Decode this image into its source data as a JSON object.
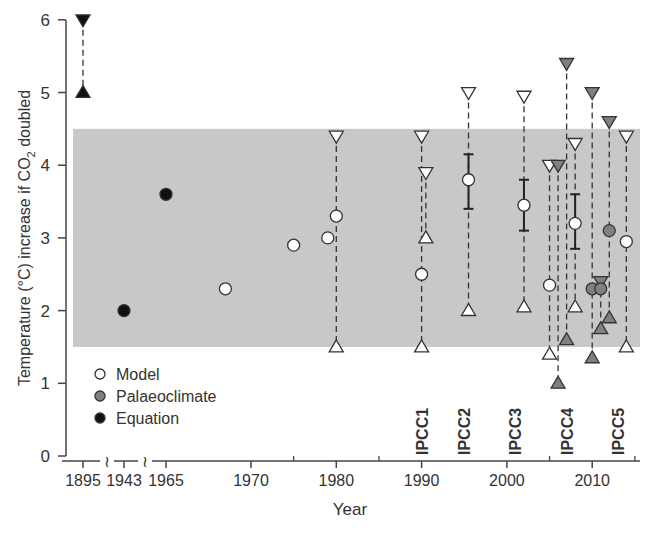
{
  "chart_data": {
    "type": "scatter",
    "title": "",
    "xlabel": "Year",
    "ylabel": "Temperature (°C) increase if CO2 doubled",
    "ylabel_parts": {
      "pre": "Temperature (°C) increase if CO",
      "sub": "2",
      "post": " doubled"
    },
    "ylim": [
      0,
      6
    ],
    "yticks": [
      0,
      1,
      2,
      3,
      4,
      5,
      6
    ],
    "xticks_broken": [
      "1895",
      "1943",
      "1965"
    ],
    "xticks": [
      "1970",
      "1980",
      "1990",
      "2000",
      "2010"
    ],
    "axis_break_symbol": "≀",
    "shaded_band": {
      "low": 1.5,
      "high": 4.5,
      "color": "#c8c8c8"
    },
    "legend": [
      {
        "label": "Model",
        "marker": "circle",
        "fill": "#ffffff"
      },
      {
        "label": "Palaeoclimate",
        "marker": "circle",
        "fill": "#808080"
      },
      {
        "label": "Equation",
        "marker": "circle",
        "fill": "#111111"
      }
    ],
    "ipcc_reports": [
      {
        "label": "IPCC1",
        "year": 1990
      },
      {
        "label": "IPCC2",
        "year": 1995
      },
      {
        "label": "IPCC3",
        "year": 2001
      },
      {
        "label": "IPCC4",
        "year": 2007
      },
      {
        "label": "IPCC5",
        "year": 2013
      }
    ],
    "colors": {
      "model": "#ffffff",
      "palaeoclimate": "#808080",
      "equation": "#111111",
      "stroke": "#333333"
    },
    "points": [
      {
        "type": "equation",
        "x": "1943",
        "y": 2.0
      },
      {
        "type": "equation",
        "x": "1965",
        "y": 3.6
      },
      {
        "type": "model",
        "x": 1967,
        "y": 2.3
      },
      {
        "type": "model",
        "x": 1975,
        "y": 2.9
      },
      {
        "type": "model",
        "x": 1979,
        "y": 3.0
      },
      {
        "type": "model",
        "x": 1980,
        "y": 3.3
      },
      {
        "type": "model",
        "x": 1990,
        "y": 2.5
      },
      {
        "type": "model",
        "x": 1995.5,
        "y": 3.8
      },
      {
        "type": "model",
        "x": 2002,
        "y": 3.45
      },
      {
        "type": "model",
        "x": 2005,
        "y": 2.35
      },
      {
        "type": "model",
        "x": 2008,
        "y": 3.2
      },
      {
        "type": "palaeoclimate",
        "x": 2010,
        "y": 2.3
      },
      {
        "type": "palaeoclimate",
        "x": 2011,
        "y": 2.3
      },
      {
        "type": "palaeoclimate",
        "x": 2012,
        "y": 3.1
      },
      {
        "type": "model",
        "x": 2014,
        "y": 2.95
      }
    ],
    "ranges": [
      {
        "type": "equation",
        "x": "1895",
        "low": 5.0,
        "high": 6.0
      },
      {
        "type": "model",
        "x": 1980,
        "low": 1.5,
        "high": 4.4
      },
      {
        "type": "model",
        "x": 1990,
        "low": 1.5,
        "high": 4.4
      },
      {
        "type": "model",
        "x": 1990.5,
        "low": 3.0,
        "high": 3.9
      },
      {
        "type": "model",
        "x": 1995.5,
        "low": 2.0,
        "high": 5.0
      },
      {
        "type": "model",
        "x": 2002,
        "low": 2.05,
        "high": 4.95
      },
      {
        "type": "model",
        "x": 2005,
        "low": 1.4,
        "high": 4.0
      },
      {
        "type": "palaeoclimate",
        "x": 2006,
        "low": 1.0,
        "high": 4.0
      },
      {
        "type": "palaeoclimate",
        "x": 2007,
        "low": 1.6,
        "high": 5.4
      },
      {
        "type": "model",
        "x": 2008,
        "low": 2.05,
        "high": 4.3
      },
      {
        "type": "palaeoclimate",
        "x": 2010,
        "low": 1.35,
        "high": 5.0
      },
      {
        "type": "palaeoclimate",
        "x": 2011,
        "low": 1.75,
        "high": 2.4
      },
      {
        "type": "palaeoclimate",
        "x": 2012,
        "low": 1.9,
        "high": 4.6
      },
      {
        "type": "model",
        "x": 2014,
        "low": 1.5,
        "high": 4.4
      }
    ],
    "error_bars": [
      {
        "x": 1995.5,
        "low": 3.4,
        "high": 4.15
      },
      {
        "x": 2002,
        "low": 3.1,
        "high": 3.8
      },
      {
        "x": 2008,
        "low": 2.85,
        "high": 3.6
      }
    ],
    "grid": false,
    "legend_position": "lower-left inside"
  }
}
